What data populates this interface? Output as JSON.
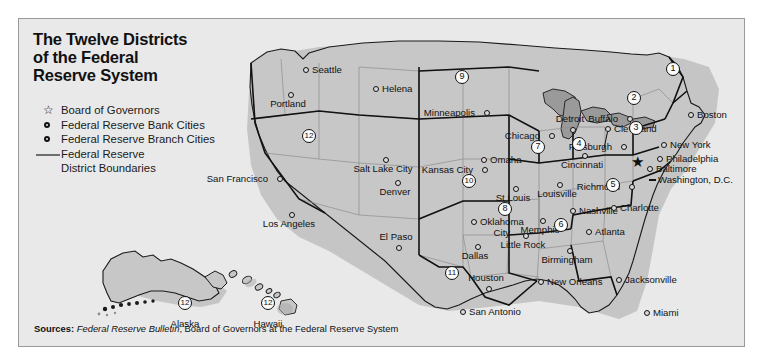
{
  "panel": {
    "background": "#e9e9e9",
    "border_color": "#9a9a9a"
  },
  "title": "The Twelve Districts\nof the Federal\nReserve System",
  "legend": {
    "items": [
      {
        "symbol": "star-icon",
        "label": "Board of Governors"
      },
      {
        "symbol": "bank-city-icon",
        "label": "Federal Reserve Bank Cities"
      },
      {
        "symbol": "branch-city-icon",
        "label": "Federal Reserve Branch Cities"
      },
      {
        "symbol": "boundary-line-icon",
        "label": "Federal Reserve"
      }
    ],
    "continuation": "District Boundaries"
  },
  "footer": {
    "label": "Sources:",
    "italic": "Federal Reserve Bulletin",
    "rest": ", Board of Governors at the Federal Reserve System"
  },
  "map": {
    "land_color": "#c7c7c7",
    "ocean_color": "#e9e9e9",
    "shadow_color": "#a8a8a8",
    "boundary_color": "#1a1a1a",
    "state_line_color": "#8e8e8e",
    "districts": [
      {
        "number": "1",
        "x": 654,
        "y": 50
      },
      {
        "number": "2",
        "x": 615,
        "y": 79
      },
      {
        "number": "3",
        "x": 617,
        "y": 109
      },
      {
        "number": "4",
        "x": 560,
        "y": 125
      },
      {
        "number": "5",
        "x": 594,
        "y": 166
      },
      {
        "number": "6",
        "x": 542,
        "y": 206
      },
      {
        "number": "7",
        "x": 519,
        "y": 128
      },
      {
        "number": "8",
        "x": 486,
        "y": 190
      },
      {
        "number": "9",
        "x": 443,
        "y": 58
      },
      {
        "number": "10",
        "x": 450,
        "y": 162
      },
      {
        "number": "11",
        "x": 433,
        "y": 254
      },
      {
        "number": "12",
        "x": 290,
        "y": 117
      },
      {
        "number": "12",
        "x": 166,
        "y": 284
      },
      {
        "number": "12",
        "x": 249,
        "y": 284
      }
    ],
    "board_of_governors": {
      "x": 619,
      "y": 143
    },
    "bank_cities": [
      {
        "name": "Boston",
        "x": 672,
        "y": 96,
        "pos": "lr"
      },
      {
        "name": "New York",
        "x": 645,
        "y": 126,
        "pos": "lr"
      },
      {
        "name": "Philadelphia",
        "x": 641,
        "y": 140,
        "pos": "lr"
      },
      {
        "name": "Cleveland",
        "x": 589,
        "y": 110,
        "pos": "lr"
      },
      {
        "name": "Richmond",
        "x": 613,
        "y": 168,
        "pos": "ll"
      },
      {
        "name": "Atlanta",
        "x": 570,
        "y": 213,
        "pos": "lr"
      },
      {
        "name": "Chicago",
        "x": 533,
        "y": 117,
        "pos": "ll"
      },
      {
        "name": "St Louis",
        "x": 497,
        "y": 170,
        "pos": "lb"
      },
      {
        "name": "Minneapolis",
        "x": 468,
        "y": 94,
        "pos": "ll"
      },
      {
        "name": "Kansas City",
        "x": 466,
        "y": 151,
        "pos": "ll"
      },
      {
        "name": "Dallas",
        "x": 459,
        "y": 228,
        "pos": "lb"
      },
      {
        "name": "San Francisco",
        "x": 261,
        "y": 160,
        "pos": "ll"
      }
    ],
    "branch_cities": [
      {
        "name": "Seattle",
        "x": 287,
        "y": 51,
        "pos": "lr"
      },
      {
        "name": "Portland",
        "x": 272,
        "y": 76,
        "pos": "lb"
      },
      {
        "name": "Helena",
        "x": 357,
        "y": 70,
        "pos": "lr"
      },
      {
        "name": "Salt Lake City",
        "x": 367,
        "y": 141,
        "pos": "lb"
      },
      {
        "name": "Denver",
        "x": 379,
        "y": 164,
        "pos": "lb"
      },
      {
        "name": "Los Angeles",
        "x": 273,
        "y": 196,
        "pos": "lb"
      },
      {
        "name": "El Paso",
        "x": 380,
        "y": 229,
        "pos": "lt"
      },
      {
        "name": "Omaha",
        "x": 465,
        "y": 141,
        "pos": "lr"
      },
      {
        "name": "Oklahoma City",
        "x": 455,
        "y": 203,
        "pos": "lr"
      },
      {
        "name": "San Antonio",
        "x": 444,
        "y": 293,
        "pos": "lr"
      },
      {
        "name": "Houston",
        "x": 470,
        "y": 270,
        "pos": "lt"
      },
      {
        "name": "Little Rock",
        "x": 507,
        "y": 217,
        "pos": "lb"
      },
      {
        "name": "Memphis",
        "x": 524,
        "y": 202,
        "pos": "lb"
      },
      {
        "name": "New Orleans",
        "x": 522,
        "y": 263,
        "pos": "lr"
      },
      {
        "name": "Birmingham",
        "x": 551,
        "y": 232,
        "pos": "lb"
      },
      {
        "name": "Nashville",
        "x": 554,
        "y": 192,
        "pos": "lr"
      },
      {
        "name": "Louisville",
        "x": 541,
        "y": 166,
        "pos": "lb"
      },
      {
        "name": "Cincinnati",
        "x": 566,
        "y": 137,
        "pos": "lb"
      },
      {
        "name": "Detroit",
        "x": 554,
        "y": 111,
        "pos": "lt"
      },
      {
        "name": "Pittsburgh",
        "x": 605,
        "y": 128,
        "pos": "ll"
      },
      {
        "name": "Buffalo",
        "x": 611,
        "y": 100,
        "pos": "ll"
      },
      {
        "name": "Baltimore",
        "x": 631,
        "y": 150,
        "pos": "lr"
      },
      {
        "name": "Charlotte",
        "x": 595,
        "y": 189,
        "pos": "lr"
      },
      {
        "name": "Jacksonville",
        "x": 600,
        "y": 261,
        "pos": "lr"
      },
      {
        "name": "Miami",
        "x": 628,
        "y": 294,
        "pos": "lr"
      }
    ],
    "capital": {
      "name": "Washington, D.C.",
      "x": 633,
      "y": 161
    },
    "insets": [
      {
        "name": "Alaska",
        "label_x": 166,
        "label_y": 299
      },
      {
        "name": "Hawaii",
        "label_x": 249,
        "label_y": 299
      }
    ]
  }
}
